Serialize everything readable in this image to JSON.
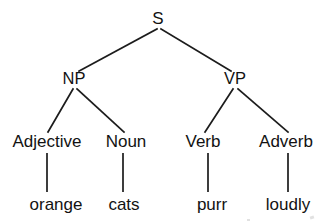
{
  "figure": {
    "kind": "syntax-tree",
    "sentence": "orange cats purr loudly",
    "background_color": "#ffffff",
    "ink_color": "#1c1c1c"
  },
  "nodes": {
    "root": {
      "label": "S",
      "x": 158,
      "y": 24
    },
    "np": {
      "label": "NP",
      "x": 74,
      "y": 84
    },
    "vp": {
      "label": "VP",
      "x": 235,
      "y": 84
    },
    "adjective": {
      "label": "Adjective",
      "x": 47,
      "y": 147
    },
    "noun": {
      "label": "Noun",
      "x": 126,
      "y": 147
    },
    "verb": {
      "label": "Verb",
      "x": 203,
      "y": 147
    },
    "adverb": {
      "label": "Adverb",
      "x": 286,
      "y": 147
    },
    "word_orange": {
      "label": "orange",
      "x": 56,
      "y": 210
    },
    "word_cats": {
      "label": "cats",
      "x": 124,
      "y": 210
    },
    "word_purr": {
      "label": "purr",
      "x": 212,
      "y": 210
    },
    "word_loudly": {
      "label": "loudly",
      "x": 288,
      "y": 210
    }
  },
  "edges": {
    "s_to_np": {
      "from": "S",
      "to": "NP",
      "path": "M 157 29 L 79 71"
    },
    "s_to_vp": {
      "from": "S",
      "to": "VP",
      "path": "M 161 29 L 231 71"
    },
    "np_to_adjective": {
      "from": "NP",
      "to": "Adjective",
      "path": "M 73 89 L 48 132"
    },
    "np_to_noun": {
      "from": "NP",
      "to": "Noun",
      "path": "M 77 89 L 124 132"
    },
    "vp_to_verb": {
      "from": "VP",
      "to": "Verb",
      "path": "M 233 89 L 205 132"
    },
    "vp_to_adverb": {
      "from": "VP",
      "to": "Adverb",
      "path": "M 238 89 L 288 132"
    },
    "adjective_to_orange": {
      "from": "Adjective",
      "to": "orange",
      "path": "M 47 153 L 47 192"
    },
    "noun_to_cats": {
      "from": "Noun",
      "to": "cats",
      "path": "M 123 153 L 123 192"
    },
    "verb_to_purr": {
      "from": "Verb",
      "to": "purr",
      "path": "M 208 153 L 208 192"
    },
    "adverb_to_loudly": {
      "from": "Adverb",
      "to": "loudly",
      "path": "M 288 153 L 288 192"
    }
  }
}
